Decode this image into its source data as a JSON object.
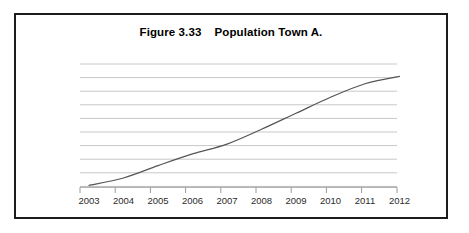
{
  "figure": {
    "title": "Figure 3.33    Population Town A.",
    "border_color": "#1c1c1c",
    "background_color": "#ffffff"
  },
  "chart_data": {
    "type": "line",
    "title": "Figure 3.33    Population Town A.",
    "xlabel": "",
    "ylabel": "",
    "grid": true,
    "gridlines_count": 10,
    "legend": null,
    "legend_position": "none",
    "line_color": "#555555",
    "grid_color": "#c8c8c8",
    "axis_color": "#9a9a9a",
    "x": [
      2003,
      2004,
      2005,
      2006,
      2007,
      2008,
      2009,
      2010,
      2011,
      2012
    ],
    "categories": [
      "2003",
      "2004",
      "2005",
      "2006",
      "2007",
      "2008",
      "2009",
      "2010",
      "2011",
      "2012"
    ],
    "xlim": [
      2003,
      2012
    ],
    "ylim": [
      0,
      10
    ],
    "values": [
      0.15,
      0.75,
      1.75,
      2.7,
      3.5,
      4.7,
      6.0,
      7.3,
      8.4,
      9.0
    ],
    "y_tick_values": [
      1,
      2,
      3,
      4,
      5,
      6,
      7,
      8,
      9,
      10
    ],
    "y_tick_labels": [
      "",
      "",
      "",
      "",
      "",
      "",
      "",
      "",
      "",
      ""
    ],
    "series": [
      {
        "name": "Population Town A",
        "values": [
          0.15,
          0.75,
          1.75,
          2.7,
          3.5,
          4.7,
          6.0,
          7.3,
          8.4,
          9.0
        ]
      }
    ]
  }
}
